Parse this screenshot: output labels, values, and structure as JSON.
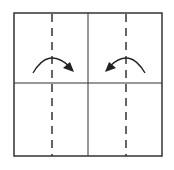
{
  "diagram": {
    "type": "origami-fold-diagram",
    "square": {
      "x": 14,
      "y": 13,
      "width": 148,
      "height": 143,
      "stroke": "#333333"
    },
    "crease_lines": {
      "vertical_center_x": 88,
      "horizontal_center_y": 83
    },
    "valley_folds": [
      {
        "x": 52,
        "style": "dashed"
      },
      {
        "x": 126,
        "style": "dashed"
      }
    ],
    "arrows": [
      {
        "name": "fold-arrow-right",
        "direction": "right",
        "from": [
          33,
          73
        ],
        "to": [
          73,
          71
        ]
      },
      {
        "name": "fold-arrow-left",
        "direction": "left",
        "from": [
          145,
          73
        ],
        "to": [
          107,
          71
        ]
      }
    ],
    "colors": {
      "line": "#333333",
      "background": "#ffffff"
    }
  }
}
